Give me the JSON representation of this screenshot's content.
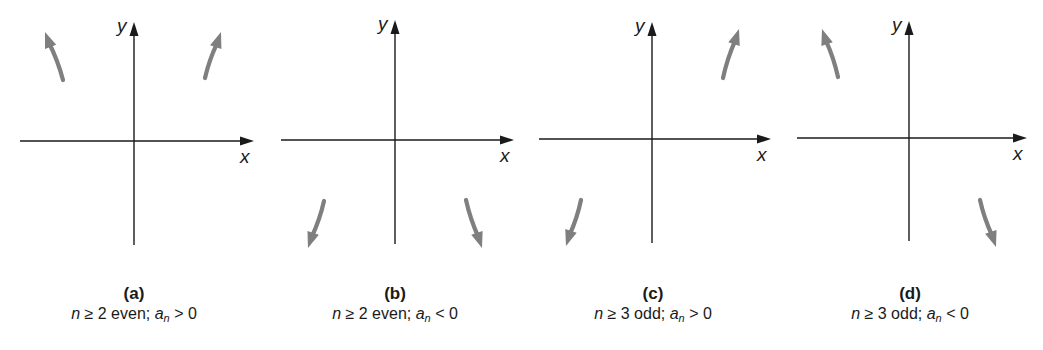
{
  "figure": {
    "colors": {
      "axis": "#1a1a1a",
      "end_arrow": "#7f7f7f",
      "background": "#ffffff"
    },
    "panels": [
      {
        "id": "a",
        "label": "(a)",
        "condition": {
          "var": "n",
          "rel": "≥",
          "n_value": "2",
          "parity": "even;",
          "coef": "a",
          "coef_sub": "n",
          "sign": ">",
          "zero": "0"
        },
        "axes": {
          "origin": [
            134,
            141
          ],
          "x_range": [
            20,
            254
          ],
          "y_range": [
            22,
            245
          ],
          "x_label": "x",
          "y_label": "y"
        },
        "end_arrows": [
          {
            "position": "upper-left",
            "tail": [
              63,
              80
            ],
            "head": [
              45,
              32
            ]
          },
          {
            "position": "upper-right",
            "tail": [
              205,
              78
            ],
            "head": [
              221,
              32
            ]
          }
        ],
        "caption_center_x": 134
      },
      {
        "id": "b",
        "label": "(b)",
        "condition": {
          "var": "n",
          "rel": "≥",
          "n_value": "2",
          "parity": "even;",
          "coef": "a",
          "coef_sub": "n",
          "sign": "<",
          "zero": "0"
        },
        "axes": {
          "origin": [
            395,
            140
          ],
          "x_range": [
            281,
            514
          ],
          "y_range": [
            20,
            244
          ],
          "x_label": "x",
          "y_label": "y"
        },
        "end_arrows": [
          {
            "position": "lower-left",
            "tail": [
              324,
              201
            ],
            "head": [
              308,
              248
            ]
          },
          {
            "position": "lower-right",
            "tail": [
              466,
              200
            ],
            "head": [
              482,
              248
            ]
          }
        ],
        "caption_center_x": 395
      },
      {
        "id": "c",
        "label": "(c)",
        "condition": {
          "var": "n",
          "rel": "≥",
          "n_value": "3",
          "parity": "odd;",
          "coef": "a",
          "coef_sub": "n",
          "sign": ">",
          "zero": "0"
        },
        "axes": {
          "origin": [
            652,
            139
          ],
          "x_range": [
            539,
            771
          ],
          "y_range": [
            22,
            243
          ],
          "x_label": "x",
          "y_label": "y"
        },
        "end_arrows": [
          {
            "position": "lower-left",
            "tail": [
              581,
              200
            ],
            "head": [
              566,
              246
            ]
          },
          {
            "position": "upper-right",
            "tail": [
              723,
              78
            ],
            "head": [
              739,
              29
            ]
          }
        ],
        "caption_center_x": 653
      },
      {
        "id": "d",
        "label": "(d)",
        "condition": {
          "var": "n",
          "rel": "≥",
          "n_value": "3",
          "parity": "odd;",
          "coef": "a",
          "coef_sub": "n",
          "sign": "<",
          "zero": "0"
        },
        "axes": {
          "origin": [
            909,
            138
          ],
          "x_range": [
            797,
            1027
          ],
          "y_range": [
            21,
            241
          ],
          "x_label": "x",
          "y_label": "y"
        },
        "end_arrows": [
          {
            "position": "upper-left",
            "tail": [
              838,
              77
            ],
            "head": [
              822,
              29
            ]
          },
          {
            "position": "lower-right",
            "tail": [
              980,
              200
            ],
            "head": [
              996,
              247
            ]
          }
        ],
        "caption_center_x": 910
      }
    ]
  }
}
